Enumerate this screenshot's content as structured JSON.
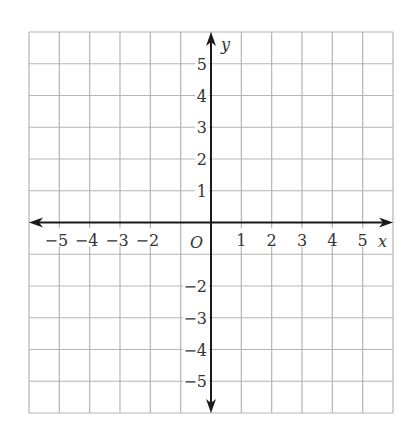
{
  "chart_data": {
    "type": "scatter",
    "title": "",
    "xlabel": "x",
    "ylabel": "y",
    "origin_label": "O",
    "xlim": [
      -6,
      6
    ],
    "ylim": [
      -6,
      6
    ],
    "grid": true,
    "x_tick_labels": [
      "−5",
      "−4",
      "−3",
      "−2",
      "1",
      "2",
      "3",
      "4",
      "5"
    ],
    "x_tick_values": [
      -5,
      -4,
      -3,
      -2,
      1,
      2,
      3,
      4,
      5
    ],
    "y_tick_labels": [
      "5",
      "4",
      "3",
      "2",
      "1",
      "−2",
      "−3",
      "−4",
      "−5"
    ],
    "y_tick_values": [
      5,
      4,
      3,
      2,
      1,
      -2,
      -3,
      -4,
      -5
    ],
    "series": [],
    "colors": {
      "grid": "#b5b5b5",
      "axis": "#1a1a1a",
      "text": "#333333"
    }
  }
}
